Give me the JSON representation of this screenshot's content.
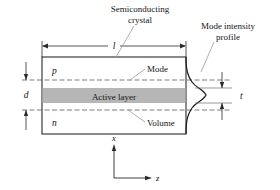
{
  "figure": {
    "title_labels": {
      "semiconducting_crystal_line1": "Semiconducting",
      "semiconducting_crystal_line2": "crystal",
      "mode_intensity_line1": "Mode intensity",
      "mode_intensity_line2": "profile"
    },
    "region_labels": {
      "p_layer": "p",
      "n_layer": "n",
      "active_layer": "Active layer",
      "mode": "Mode",
      "volume": "Volume"
    },
    "dimensions": {
      "length": "l",
      "depth": "d",
      "thickness": "t"
    },
    "axes": {
      "vertical": "x",
      "horizontal": "z"
    },
    "colors": {
      "active_layer_fill": "#b6b6b6",
      "outline": "#2b2b2b",
      "dashed_line": "#5c5c5c",
      "leader_line": "#9a9a9a",
      "background": "#ffffff"
    }
  }
}
